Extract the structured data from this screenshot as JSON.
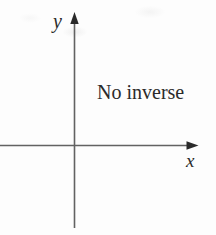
{
  "diagram": {
    "type": "coordinate-axes",
    "annotation": "No inverse",
    "x_axis_label": "x",
    "y_axis_label": "y"
  },
  "colors": {
    "background": "#fdfdfd",
    "axis_line": "#626262",
    "arrowhead": "#2a2a2a",
    "text": "#2b2b2b"
  }
}
